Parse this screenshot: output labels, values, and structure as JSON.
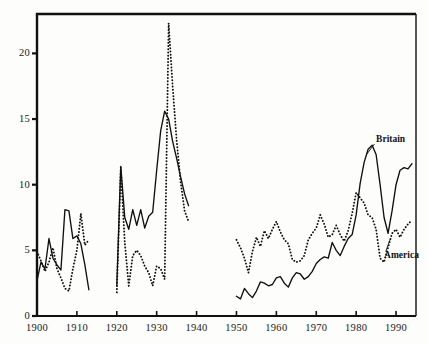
{
  "chart_data": {
    "type": "line",
    "title": "",
    "subtitle": "",
    "xlabel": "",
    "ylabel": "",
    "xlim": [
      1900,
      1995
    ],
    "ylim": [
      0,
      23
    ],
    "grid": false,
    "legend_position": "inline-annotation",
    "xticks": [
      1900,
      1910,
      1920,
      1930,
      1940,
      1950,
      1960,
      1970,
      1980,
      1990
    ],
    "xtick_labels": [
      "1900",
      "1910",
      "1920",
      "1930",
      "1940",
      "1950",
      "1960",
      "1970",
      "1980",
      "1990"
    ],
    "yticks": [
      0,
      5,
      10,
      15,
      20
    ],
    "ytick_labels": [
      "0",
      "5",
      "10",
      "15",
      "20"
    ],
    "annotations": [
      {
        "text": "Britain",
        "x": 1985,
        "y": 13.3
      },
      {
        "text": "America",
        "x": 1987,
        "y": 4.6
      }
    ],
    "series": [
      {
        "name": "Britain",
        "style": "solid",
        "color": "#101010",
        "segments": [
          {
            "x": [
              1900,
              1901,
              1902,
              1903,
              1904,
              1905,
              1906,
              1907,
              1908,
              1909,
              1910,
              1911,
              1912,
              1913
            ],
            "y": [
              2.7,
              4.1,
              3.6,
              5.9,
              4.4,
              3.9,
              3.5,
              8.1,
              8.0,
              5.9,
              6.1,
              5.5,
              3.9,
              2.0
            ]
          },
          {
            "x": [
              1920,
              1921,
              1922,
              1923,
              1924,
              1925,
              1926,
              1927,
              1928,
              1929,
              1930,
              1931,
              1932,
              1933,
              1934,
              1935,
              1936,
              1937,
              1938
            ],
            "y": [
              2.3,
              11.4,
              7.5,
              6.6,
              8.1,
              6.9,
              8.1,
              6.7,
              7.6,
              7.9,
              11.1,
              14.1,
              15.6,
              15.0,
              13.3,
              12.0,
              10.6,
              9.3,
              8.4
            ]
          },
          {
            "x": [
              1950,
              1951,
              1952,
              1953,
              1954,
              1955,
              1956,
              1957,
              1958,
              1959,
              1960,
              1961,
              1962,
              1963,
              1964,
              1965,
              1966,
              1967,
              1968,
              1969,
              1970,
              1971,
              1972,
              1973,
              1974,
              1975,
              1976,
              1977,
              1978,
              1979,
              1980,
              1981,
              1982,
              1983,
              1984,
              1985,
              1986,
              1987,
              1988,
              1989,
              1990,
              1991,
              1992,
              1993,
              1994
            ],
            "y": [
              1.5,
              1.3,
              2.1,
              1.7,
              1.4,
              1.9,
              2.6,
              2.5,
              2.3,
              2.4,
              2.9,
              3.0,
              2.5,
              2.2,
              2.9,
              3.3,
              3.2,
              2.8,
              3.0,
              3.4,
              4.0,
              4.3,
              4.5,
              4.4,
              5.6,
              5.0,
              4.6,
              5.3,
              5.9,
              6.2,
              7.7,
              10.1,
              11.7,
              12.7,
              13.0,
              12.3,
              10.0,
              7.5,
              6.3,
              8.0,
              10.0,
              11.1,
              11.3,
              11.2,
              11.6
            ]
          }
        ]
      },
      {
        "name": "America",
        "style": "dotted",
        "color": "#101010",
        "segments": [
          {
            "x": [
              1900,
              1901,
              1902,
              1903,
              1904,
              1905,
              1906,
              1907,
              1908,
              1909,
              1910,
              1911,
              1912,
              1913
            ],
            "y": [
              4.9,
              4.2,
              3.4,
              4.1,
              5.2,
              3.6,
              2.9,
              2.1,
              1.9,
              3.6,
              5.0,
              7.8,
              5.4,
              5.8,
              6.6,
              4.8
            ]
          },
          {
            "x": [
              1920,
              1921,
              1922,
              1923,
              1924,
              1925,
              1926,
              1927,
              1928,
              1929,
              1930,
              1931,
              1932,
              1933,
              1934,
              1935,
              1936,
              1937,
              1938
            ],
            "y": [
              1.8,
              11.3,
              5.6,
              2.3,
              4.6,
              5.0,
              4.6,
              3.8,
              3.3,
              2.3,
              3.8,
              3.6,
              2.8,
              22.3,
              17.5,
              13.4,
              10.2,
              8.0,
              7.2,
              12.6
            ]
          },
          {
            "x": [
              1950,
              1951,
              1952,
              1953,
              1954,
              1955,
              1956,
              1957,
              1958,
              1959,
              1960,
              1961,
              1962,
              1963,
              1964,
              1965,
              1966,
              1967,
              1968,
              1969,
              1970,
              1971,
              1972,
              1973,
              1974,
              1975,
              1976,
              1977,
              1978,
              1979,
              1980,
              1981,
              1982,
              1983,
              1984,
              1985,
              1986,
              1987,
              1988,
              1989,
              1990,
              1991,
              1992,
              1993,
              1994
            ],
            "y": [
              5.8,
              5.2,
              4.4,
              3.3,
              4.9,
              6.0,
              5.3,
              6.5,
              5.9,
              6.6,
              7.2,
              6.4,
              5.8,
              5.5,
              4.3,
              4.1,
              4.2,
              4.6,
              5.8,
              6.3,
              6.7,
              7.7,
              7.0,
              6.0,
              6.2,
              6.9,
              6.2,
              5.7,
              6.5,
              7.8,
              9.4,
              9.0,
              8.6,
              7.7,
              7.5,
              6.6,
              4.4,
              4.1,
              5.2,
              6.3,
              6.6,
              6.0,
              6.6,
              7.0,
              7.3
            ]
          }
        ]
      }
    ]
  },
  "axes": {
    "x_ticks": [
      "1900",
      "1910",
      "1920",
      "1930",
      "1940",
      "1950",
      "1960",
      "1970",
      "1980",
      "1990"
    ],
    "y_ticks": [
      "0",
      "5",
      "10",
      "15",
      "20"
    ]
  },
  "labels": {
    "britain": "Britain",
    "america": "America"
  }
}
